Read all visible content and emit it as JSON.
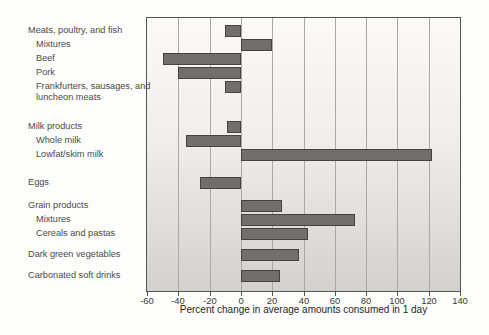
{
  "chart_data": {
    "type": "bar",
    "orientation": "horizontal",
    "title": "",
    "xlabel": "Percent change in average amounts consumed in 1 day",
    "ylabel": "",
    "xlim": [
      -60,
      140
    ],
    "grid": "vertical gridlines every 20 units",
    "legend": "none",
    "xticks": [
      {
        "value": -60,
        "label": "-60"
      },
      {
        "value": -40,
        "label": "-40"
      },
      {
        "value": -20,
        "label": "-20"
      },
      {
        "value": 0,
        "label": "0"
      },
      {
        "value": 20,
        "label": "20"
      },
      {
        "value": 40,
        "label": "40"
      },
      {
        "value": 60,
        "label": "60"
      },
      {
        "value": 80,
        "label": "80"
      },
      {
        "value": 100,
        "label": "100"
      },
      {
        "value": 120,
        "label": "120"
      },
      {
        "value": 140,
        "label": "140"
      }
    ],
    "rows": [
      {
        "label": "Meats, poultry, and fish",
        "indent": 0,
        "value": -10,
        "wrap": false
      },
      {
        "label": "Mixtures",
        "indent": 1,
        "value": 20,
        "wrap": false
      },
      {
        "label": "Beef",
        "indent": 1,
        "value": -50,
        "wrap": false
      },
      {
        "label": "Pork",
        "indent": 1,
        "value": -40,
        "wrap": false
      },
      {
        "label": "Frankfurters, sausages, and luncheon meats",
        "indent": 1,
        "value": -10,
        "wrap": true
      },
      {
        "label": "Milk products",
        "indent": 0,
        "value": -9,
        "wrap": false
      },
      {
        "label": "Whole milk",
        "indent": 1,
        "value": -35,
        "wrap": false
      },
      {
        "label": "Lowfat/skim milk",
        "indent": 1,
        "value": 122,
        "wrap": false
      },
      {
        "label": "Eggs",
        "indent": 0,
        "value": -26,
        "wrap": false
      },
      {
        "label": "Grain products",
        "indent": 0,
        "value": 26,
        "wrap": false
      },
      {
        "label": "Mixtures",
        "indent": 1,
        "value": 73,
        "wrap": false
      },
      {
        "label": "Cereals and pastas",
        "indent": 1,
        "value": 43,
        "wrap": false
      },
      {
        "label": "Dark green vegetables",
        "indent": 0,
        "value": 37,
        "wrap": false
      },
      {
        "label": "Carbonated soft drinks",
        "indent": 0,
        "value": 25,
        "wrap": false
      }
    ],
    "colors": {
      "bar_fill": "#716f6d",
      "bar_border": "#45433f",
      "gridline": "#a9a8a5",
      "plot_border": "#55534f",
      "label_text": "#4b4a47",
      "tick_text": "#3a3936",
      "title_text": "#262524"
    }
  }
}
